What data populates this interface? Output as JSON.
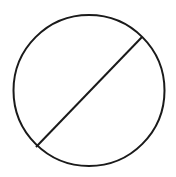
{
  "diagram": {
    "width": 176,
    "height": 177,
    "background": "#ffffff",
    "stroke_color": "#1a1a1a",
    "stroke_width": 2,
    "circle": {
      "cx": 89,
      "cy": 90.5,
      "r": 75.5
    },
    "chord": {
      "x1": 142,
      "y1": 37,
      "x2": 36,
      "y2": 147
    }
  }
}
